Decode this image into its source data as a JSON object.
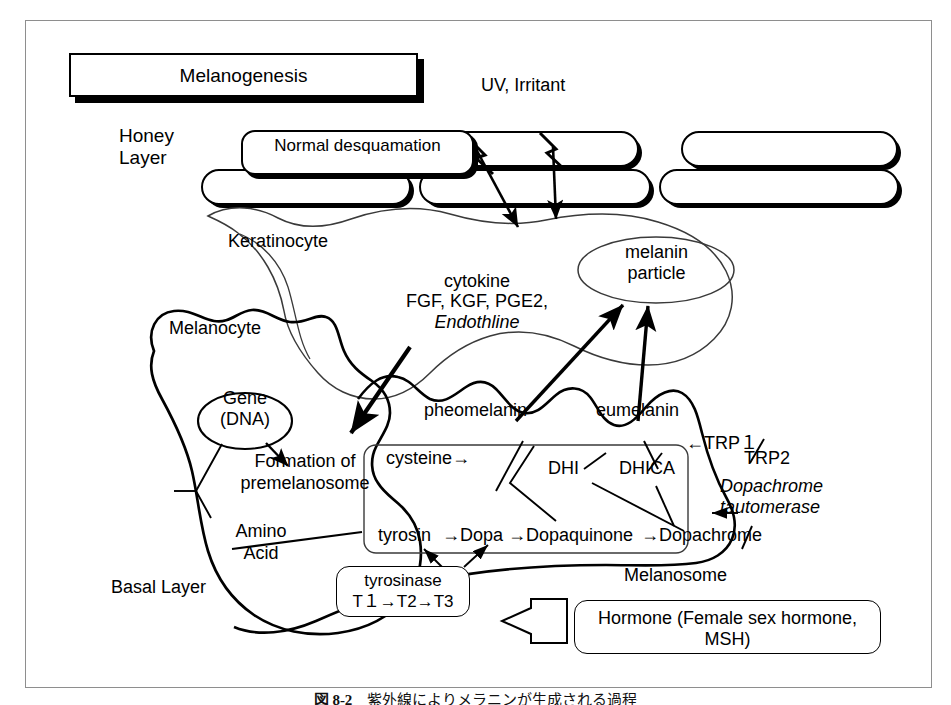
{
  "figure": {
    "title_box": "Melanogenesis",
    "caption_label": "図 8-2",
    "caption_text": "紫外線によりメラニンが生成される過程"
  },
  "layers": {
    "honey_layer": "Honey\nLayer",
    "basal_layer": "Basal Layer"
  },
  "stimulus": {
    "uv_irritant": "UV, Irritant"
  },
  "cells": {
    "normal_desquamation": "Normal\ndesquamation",
    "keratinocyte": "Keratinocyte",
    "melanocyte": "Melanocyte",
    "melanosome": "Melanosome",
    "melanin_particle": "melanin\nparticle",
    "gene_dna": "Gene\n(DNA)"
  },
  "signals": {
    "cytokine_title": "cytokine",
    "cytokine_list": "FGF, KGF, PGE2,",
    "cytokine_italic": "Endothline"
  },
  "processes": {
    "formation": "Formation of\npremelanosome",
    "amino_acid": "Amino\nAcid"
  },
  "pathway": {
    "cysteine": "cysteine→",
    "chain": [
      "tyrosin",
      "Dopa",
      "Dopaquinone",
      "Dopachrome"
    ],
    "chain_arrow": "→",
    "dhi": "DHI",
    "dhica": "DHICA",
    "pheomelanin": "pheomelanin",
    "eumelanin": "eumelanin"
  },
  "enzymes": {
    "trp1": "←TRP１",
    "trp2": "TRP2",
    "dopachrome_tautomerase": "Dopachrome\ntautomerase",
    "dopachrome_taut_arrow": "←",
    "tyrosinase_name": "tyrosinase",
    "tyrosinase_stages": "T１→T2→T3"
  },
  "hormone": {
    "label": "Hormone (Female sex\nhormone, MSH)"
  },
  "colors": {
    "ink": "#000000",
    "frame": "#8e8e8e",
    "paper": "#ffffff",
    "thin_outline": "#3a3a3a"
  }
}
